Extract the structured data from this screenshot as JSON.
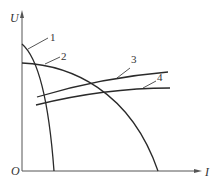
{
  "diagram": {
    "type": "characteristic-curves",
    "axes": {
      "x_label": "I",
      "y_label": "U",
      "origin_label": "O"
    },
    "curves": [
      {
        "id": "1",
        "label": "1",
        "description": "steep drooping curve starting high on U axis, falling to I axis near origin"
      },
      {
        "id": "2",
        "label": "2",
        "description": "gently drooping curve starting lower on U axis, falling to I axis far right"
      },
      {
        "id": "3",
        "label": "3",
        "description": "rising line"
      },
      {
        "id": "4",
        "label": "4",
        "description": "slightly rising line below line 3"
      }
    ],
    "colors": {
      "line": "#2a2a2a",
      "axis": "#555555",
      "background": "#ffffff"
    }
  }
}
